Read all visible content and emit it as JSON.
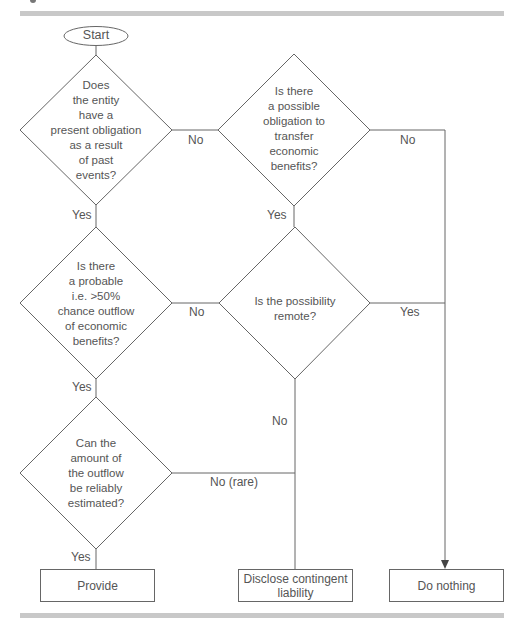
{
  "diagram": {
    "type": "flowchart",
    "start": {
      "label": "Start"
    },
    "decisions": [
      {
        "id": "q1",
        "text": "Does\nthe entity\nhave a\npresent obligation\nas a result\nof past\nevents?"
      },
      {
        "id": "q2",
        "text": "Is there\na possible\nobligation to\ntransfer\neconomic\nbenefits?"
      },
      {
        "id": "q3",
        "text": "Is there\na probable\ni.e. >50%\nchance outflow\nof economic\nbenefits?"
      },
      {
        "id": "q4",
        "text": "Is the possibility\nremote?"
      },
      {
        "id": "q5",
        "text": "Can the\namount of\nthe outflow\nbe reliably\nestimated?"
      }
    ],
    "outcomes": [
      {
        "id": "provide",
        "label": "Provide"
      },
      {
        "id": "disclose",
        "label": "Disclose contingent\nliability"
      },
      {
        "id": "nothing",
        "label": "Do nothing"
      }
    ],
    "edge_labels": {
      "q1_no": "No",
      "q1_yes": "Yes",
      "q2_no": "No",
      "q2_yes": "Yes",
      "q3_no": "No",
      "q3_yes": "Yes",
      "q4_yes": "Yes",
      "q4_no": "No",
      "q5_no": "No (rare)",
      "q5_yes": "Yes"
    },
    "edges": [
      {
        "from": "start",
        "to": "q1"
      },
      {
        "from": "q1",
        "to": "q2",
        "label": "No"
      },
      {
        "from": "q1",
        "to": "q3",
        "label": "Yes"
      },
      {
        "from": "q2",
        "to": "nothing",
        "label": "No"
      },
      {
        "from": "q2",
        "to": "q4",
        "label": "Yes"
      },
      {
        "from": "q3",
        "to": "q4",
        "label": "No"
      },
      {
        "from": "q3",
        "to": "q5",
        "label": "Yes"
      },
      {
        "from": "q4",
        "to": "nothing",
        "label": "Yes"
      },
      {
        "from": "q4",
        "to": "disclose",
        "label": "No"
      },
      {
        "from": "q5",
        "to": "disclose",
        "label": "No (rare)"
      },
      {
        "from": "q5",
        "to": "provide",
        "label": "Yes"
      }
    ],
    "colors": {
      "line": "#666666",
      "text": "#555555",
      "rule": "#c8c8c8"
    }
  }
}
